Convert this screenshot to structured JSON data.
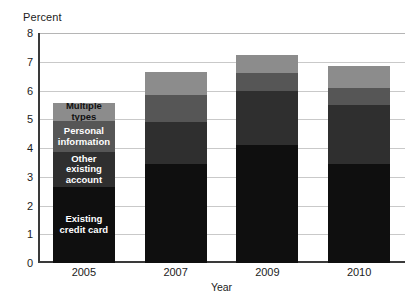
{
  "chart_data": {
    "type": "bar",
    "subtype": "stacked-vertical",
    "title": "",
    "xlabel": "Year",
    "ylabel": "Percent",
    "categories": [
      "2005",
      "2007",
      "2009",
      "2010"
    ],
    "ylim": [
      0,
      8
    ],
    "yticks": [
      0,
      1,
      2,
      3,
      4,
      5,
      6,
      7,
      8
    ],
    "ytick_labels": [
      "0",
      "1",
      "2",
      "3",
      "4",
      "5",
      "6",
      "7",
      "8"
    ],
    "grid": true,
    "grid_axis": "y",
    "legend_position": "inline-first-bar",
    "series": [
      {
        "name": "Existing credit card",
        "color": "#0f0f0f",
        "label_color": "#ffffff",
        "values": [
          2.65,
          3.45,
          4.1,
          3.45
        ]
      },
      {
        "name": "Other existing account",
        "color": "#2f2f2f",
        "label_color": "#ffffff",
        "values": [
          1.2,
          1.45,
          1.9,
          2.05
        ]
      },
      {
        "name": "Personal information",
        "color": "#565656",
        "label_color": "#ffffff",
        "values": [
          1.1,
          0.95,
          0.6,
          0.6
        ]
      },
      {
        "name": "Multiple types",
        "color": "#8c8c8c",
        "label_color": "#111111",
        "values": [
          0.6,
          0.8,
          0.65,
          0.75
        ]
      }
    ],
    "totals": [
      5.55,
      6.65,
      7.25,
      6.85
    ],
    "annotations": [
      {
        "text": "Multiple types",
        "series": "Multiple types",
        "category": "2005"
      },
      {
        "text": "Personal\ninformation",
        "series": "Personal information",
        "category": "2005"
      },
      {
        "text": "Other existing\naccount",
        "series": "Other existing account",
        "category": "2005"
      },
      {
        "text": "Existing\ncredit card",
        "series": "Existing credit card",
        "category": "2005"
      }
    ]
  },
  "colors": {
    "background": "#ffffff",
    "axis": "#3a3a3a",
    "gridline": "#c9c9c9",
    "text": "#1c1c1c"
  }
}
